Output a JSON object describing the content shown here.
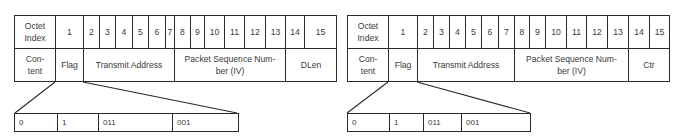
{
  "diagrams": [
    {
      "header_label": "Octet Index",
      "header_label_lines": [
        "Octet",
        "Index"
      ],
      "octets": [
        "1",
        "2",
        "3",
        "4",
        "5",
        "6",
        "7",
        "8",
        "9",
        "10",
        "11",
        "12",
        "13",
        "14",
        "15"
      ],
      "content_label_lines": [
        "Con-",
        "tent"
      ],
      "fields": [
        {
          "name": "Flag",
          "octets": "1"
        },
        {
          "name": "Transmit Address",
          "octets": "2-7"
        },
        {
          "name_lines": [
            "Packet Sequence Num-",
            "ber (IV)"
          ],
          "octets": "8-13"
        },
        {
          "name": "DLen",
          "octets": "14-15"
        }
      ],
      "flag_bits": [
        "0",
        "1",
        "011",
        "001"
      ]
    },
    {
      "header_label": "Octet Index",
      "header_label_lines": [
        "Octet",
        "Index"
      ],
      "octets": [
        "1",
        "2",
        "3",
        "4",
        "5",
        "6",
        "7",
        "8",
        "9",
        "10",
        "11",
        "12",
        "13",
        "14",
        "15"
      ],
      "content_label_lines": [
        "Con-",
        "tent"
      ],
      "fields": [
        {
          "name": "Flag",
          "octets": "1"
        },
        {
          "name": "Transmit Address",
          "octets": "2-7"
        },
        {
          "name_lines": [
            "Packet Sequence Num-",
            "ber (IV)"
          ],
          "octets": "8-13"
        },
        {
          "name": "Ctr",
          "octets": "14-15"
        }
      ],
      "flag_bits": [
        "0",
        "1",
        "011",
        "001"
      ]
    }
  ]
}
